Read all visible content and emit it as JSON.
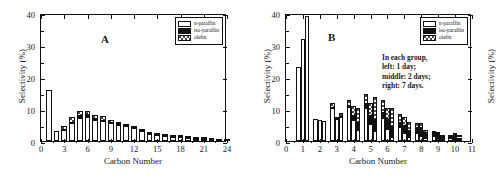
{
  "figure": {
    "panels": [
      "A",
      "B"
    ]
  },
  "legend": {
    "items": [
      {
        "key": "np",
        "label": "n-paraffin"
      },
      {
        "key": "ip",
        "label": "iso-paraffin"
      },
      {
        "key": "ol",
        "label": "olefin"
      }
    ]
  },
  "panelA": {
    "letter": "A",
    "xlabel": "Carbon Number",
    "ylabel": "Selectivity (%)",
    "xticks": [
      "0",
      "3",
      "6",
      "9",
      "12",
      "15",
      "18",
      "21",
      "24"
    ],
    "yticks": [
      "0",
      "10",
      "20",
      "30",
      "40"
    ]
  },
  "panelB": {
    "letter": "B",
    "xlabel": "Carbon Number",
    "ylabel": "Selectivity (%)",
    "xticks": [
      "0",
      "1",
      "2",
      "3",
      "4",
      "5",
      "6",
      "7",
      "8",
      "9",
      "10",
      "11"
    ],
    "yticks": [
      "0",
      "10",
      "20",
      "30",
      "40"
    ],
    "note_lines": [
      "In each group,",
      "left: 1 day;",
      "middle: 2 days;",
      "right: 7 days."
    ]
  },
  "chart_data": [
    {
      "type": "bar",
      "id": "A",
      "title": "A",
      "xlabel": "Carbon Number",
      "ylabel": "Selectivity (%)",
      "xlim": [
        0,
        24
      ],
      "ylim": [
        0,
        40
      ],
      "xticks": [
        0,
        3,
        6,
        9,
        12,
        15,
        18,
        21,
        24
      ],
      "yticks": [
        0,
        10,
        20,
        30,
        40
      ],
      "grid": false,
      "legend_position": "top-right",
      "stacked": true,
      "categories": [
        1,
        2,
        3,
        4,
        5,
        6,
        7,
        8,
        9,
        10,
        11,
        12,
        13,
        14,
        15,
        16,
        17,
        18,
        19,
        20,
        21,
        22,
        23,
        24
      ],
      "series": [
        {
          "name": "n-paraffin",
          "values": [
            16.0,
            3.0,
            3.4,
            5.6,
            7.2,
            7.4,
            6.6,
            6.2,
            5.6,
            5.1,
            4.7,
            4.0,
            3.0,
            2.2,
            1.9,
            1.7,
            1.4,
            1.1,
            0.9,
            0.7,
            0.5,
            0.4,
            0.3,
            0.2
          ]
        },
        {
          "name": "iso-paraffin",
          "values": [
            0.0,
            0.0,
            0.0,
            0.0,
            0.5,
            0.6,
            0.3,
            0.2,
            0.1,
            0.1,
            0.1,
            0.1,
            0.0,
            0.0,
            0.0,
            0.0,
            0.0,
            0.0,
            0.0,
            0.0,
            0.0,
            0.0,
            0.0,
            0.0
          ]
        },
        {
          "name": "olefin",
          "values": [
            0.0,
            0.0,
            1.3,
            2.0,
            1.6,
            1.3,
            1.3,
            1.3,
            0.9,
            0.7,
            0.6,
            0.6,
            0.5,
            0.4,
            0.3,
            0.3,
            0.2,
            0.2,
            0.1,
            0.1,
            0.1,
            0.1,
            0.0,
            0.0
          ]
        }
      ],
      "totals": [
        16.0,
        3.0,
        4.7,
        7.6,
        9.3,
        9.3,
        8.2,
        7.7,
        6.6,
        5.9,
        5.4,
        4.7,
        3.5,
        2.6,
        2.2,
        2.0,
        1.6,
        1.3,
        1.0,
        0.8,
        0.6,
        0.5,
        0.3,
        0.2
      ]
    },
    {
      "type": "bar",
      "id": "B",
      "title": "B",
      "xlabel": "Carbon Number",
      "ylabel": "Selectivity (%)",
      "xlim": [
        0,
        11
      ],
      "ylim": [
        0,
        40
      ],
      "xticks": [
        0,
        1,
        2,
        3,
        4,
        5,
        6,
        7,
        8,
        9,
        10,
        11
      ],
      "yticks": [
        0,
        10,
        20,
        30,
        40
      ],
      "grid": false,
      "legend_position": "top-right",
      "stacked": true,
      "grouped": true,
      "group_note": "In each group, left: 1 day; middle: 2 days; right: 7 days.",
      "groups": [
        "1 day",
        "2 days",
        "7 days"
      ],
      "categories": [
        1,
        2,
        3,
        4,
        5,
        6,
        7,
        8,
        9,
        10
      ],
      "data": [
        {
          "carbon": 1,
          "bars": [
            {
              "group": "1 day",
              "np": 23.0,
              "ip": 0.0,
              "ol": 0.0
            },
            {
              "group": "2 days",
              "np": 32.0,
              "ip": 0.0,
              "ol": 0.0
            },
            {
              "group": "7 days",
              "np": 39.0,
              "ip": 0.0,
              "ol": 0.0
            }
          ]
        },
        {
          "carbon": 2,
          "bars": [
            {
              "group": "1 day",
              "np": 6.8,
              "ip": 0.0,
              "ol": 0.0
            },
            {
              "group": "2 days",
              "np": 6.6,
              "ip": 0.0,
              "ol": 0.0
            },
            {
              "group": "7 days",
              "np": 6.1,
              "ip": 0.0,
              "ol": 0.0
            }
          ]
        },
        {
          "carbon": 3,
          "bars": [
            {
              "group": "1 day",
              "np": 10.4,
              "ip": 0.0,
              "ol": 1.4
            },
            {
              "group": "2 days",
              "np": 6.9,
              "ip": 0.0,
              "ol": 0.6
            },
            {
              "group": "7 days",
              "np": 7.6,
              "ip": 0.0,
              "ol": 1.2
            }
          ]
        },
        {
          "carbon": 4,
          "bars": [
            {
              "group": "1 day",
              "np": 10.5,
              "ip": 0.4,
              "ol": 1.9
            },
            {
              "group": "2 days",
              "np": 6.5,
              "ip": 1.2,
              "ol": 3.4
            },
            {
              "group": "7 days",
              "np": 3.3,
              "ip": 2.2,
              "ol": 4.9
            }
          ]
        },
        {
          "carbon": 5,
          "bars": [
            {
              "group": "1 day",
              "np": 10.3,
              "ip": 1.3,
              "ol": 3.0
            },
            {
              "group": "2 days",
              "np": 5.3,
              "ip": 2.6,
              "ol": 4.0
            },
            {
              "group": "7 days",
              "np": 3.2,
              "ip": 3.4,
              "ol": 7.1
            }
          ]
        },
        {
          "carbon": 6,
          "bars": [
            {
              "group": "1 day",
              "np": 7.3,
              "ip": 1.6,
              "ol": 3.8
            },
            {
              "group": "2 days",
              "np": 3.8,
              "ip": 3.1,
              "ol": 3.3
            },
            {
              "group": "7 days",
              "np": 1.4,
              "ip": 3.0,
              "ol": 5.9
            }
          ]
        },
        {
          "carbon": 7,
          "bars": [
            {
              "group": "1 day",
              "np": 4.3,
              "ip": 1.4,
              "ol": 2.9
            },
            {
              "group": "2 days",
              "np": 2.5,
              "ip": 2.3,
              "ol": 2.6
            },
            {
              "group": "7 days",
              "np": 1.1,
              "ip": 2.1,
              "ol": 2.8
            }
          ]
        },
        {
          "carbon": 8,
          "bars": [
            {
              "group": "1 day",
              "np": 2.5,
              "ip": 1.6,
              "ol": 1.6
            },
            {
              "group": "2 days",
              "np": 1.6,
              "ip": 2.4,
              "ol": 1.6
            },
            {
              "group": "7 days",
              "np": 0.8,
              "ip": 1.7,
              "ol": 1.0
            }
          ]
        },
        {
          "carbon": 9,
          "bars": [
            {
              "group": "1 day",
              "np": 1.5,
              "ip": 1.0,
              "ol": 0.5
            },
            {
              "group": "2 days",
              "np": 0.7,
              "ip": 1.4,
              "ol": 0.7
            },
            {
              "group": "7 days",
              "np": 0.4,
              "ip": 1.0,
              "ol": 0.4
            }
          ]
        },
        {
          "carbon": 10,
          "bars": [
            {
              "group": "1 day",
              "np": 0.8,
              "ip": 0.5,
              "ol": 0.3
            },
            {
              "group": "2 days",
              "np": 0.5,
              "ip": 1.3,
              "ol": 0.6
            },
            {
              "group": "7 days",
              "np": 0.3,
              "ip": 0.8,
              "ol": 0.3
            }
          ]
        }
      ]
    }
  ]
}
